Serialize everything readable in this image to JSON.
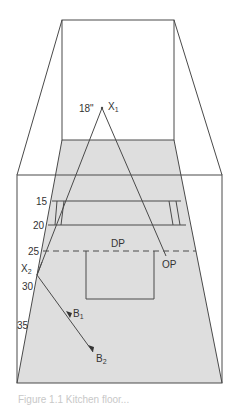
{
  "colors": {
    "line": "#4a4a4a",
    "floor": "#dedede",
    "background": "#ffffff"
  },
  "labels": {
    "height_18": "18\"",
    "x1": "X",
    "x1_sub": "1",
    "x2": "X",
    "x2_sub": "2",
    "dp": "DP",
    "op": "OP",
    "b1": "B",
    "b1_sub": "1",
    "b2": "B",
    "b2_sub": "2",
    "dist_15": "15",
    "dist_20": "20",
    "dist_25": "25",
    "dist_30": "30",
    "dist_35": "35"
  },
  "caption": "Figure 1.1   Kitchen floor..."
}
